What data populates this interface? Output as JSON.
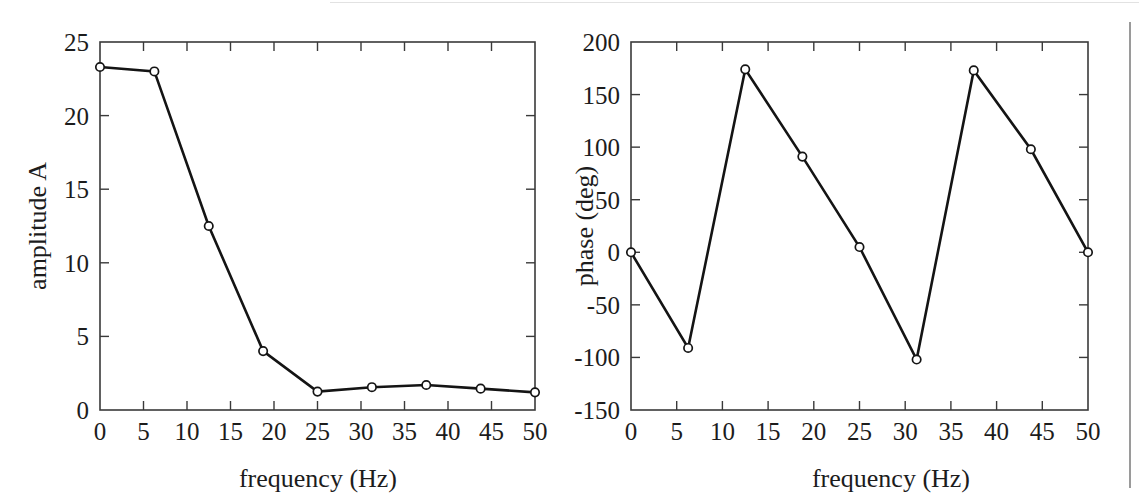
{
  "figure": {
    "background_color": "#ffffff",
    "ink_color": "#141414",
    "axis_color": "#3a3a3a",
    "marker_fill_color": "#ffffff",
    "panel_count": 2
  },
  "artifacts": {
    "top_rule_label": "scan-edge-rule-top",
    "right_rule_label": "scan-edge-rule-right"
  },
  "chart_data": [
    {
      "id": "amplitude-spectrum",
      "type": "line",
      "title": "",
      "xlabel": "frequency (Hz)",
      "ylabel": "amplitude A",
      "xlim": [
        0,
        50
      ],
      "ylim": [
        0,
        25
      ],
      "grid": false,
      "legend": "none",
      "marker": "circle",
      "xticks": [
        0,
        5,
        10,
        15,
        20,
        25,
        30,
        35,
        40,
        45,
        50
      ],
      "xtick_labels": [
        "0",
        "5",
        "10",
        "15",
        "20",
        "25",
        "30",
        "35",
        "40",
        "45",
        "50"
      ],
      "yticks": [
        0,
        5,
        10,
        15,
        20,
        25
      ],
      "ytick_labels": [
        "0",
        "5",
        "10",
        "15",
        "20",
        "25"
      ],
      "x": [
        0,
        6.25,
        12.5,
        18.75,
        25,
        31.25,
        37.5,
        43.75,
        50
      ],
      "y": [
        23.3,
        23.0,
        12.5,
        4.0,
        1.25,
        1.55,
        1.7,
        1.45,
        1.2
      ]
    },
    {
      "id": "phase-spectrum",
      "type": "line",
      "title": "",
      "xlabel": "frequency (Hz)",
      "ylabel": "phase (deg)",
      "xlim": [
        0,
        50
      ],
      "ylim": [
        -150,
        200
      ],
      "grid": false,
      "legend": "none",
      "marker": "circle",
      "xticks": [
        0,
        5,
        10,
        15,
        20,
        25,
        30,
        35,
        40,
        45,
        50
      ],
      "xtick_labels": [
        "0",
        "5",
        "10",
        "15",
        "20",
        "25",
        "30",
        "35",
        "40",
        "45",
        "50"
      ],
      "yticks": [
        -150,
        -100,
        -50,
        0,
        50,
        100,
        150,
        200
      ],
      "ytick_labels": [
        "-150",
        "-100",
        "-50",
        "0",
        "50",
        "100",
        "150",
        "200"
      ],
      "x": [
        0,
        6.25,
        12.5,
        18.75,
        25,
        31.25,
        37.5,
        43.75,
        50
      ],
      "y": [
        0,
        -91,
        174,
        91,
        5,
        -102,
        173,
        98,
        0
      ]
    }
  ]
}
